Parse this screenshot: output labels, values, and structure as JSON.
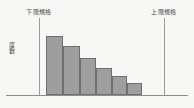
{
  "figure": {
    "background_color": "#f7f7f5",
    "axis_color": "#8d8d8d",
    "spec_line_color": "#9b9b9b",
    "bar_fill_color": "#9e9e9e",
    "bar_border_color": "#6f6f6f",
    "label_color": "#4a4a4a"
  },
  "labels": {
    "lower_spec": "下限規格",
    "upper_spec": "上限規格",
    "y_axis": "度數"
  },
  "chart_data": {
    "type": "bar",
    "title": "",
    "subtitle": "",
    "xlabel": "",
    "ylabel": "度數",
    "grid": false,
    "legend": null,
    "categories": [
      "1",
      "2",
      "3",
      "4",
      "5",
      "6"
    ],
    "values": [
      59,
      49,
      37,
      27,
      19,
      12
    ],
    "ylim": [
      0,
      64
    ],
    "xlim": [
      0,
      194
    ],
    "annotations": [
      {
        "name": "lower-spec-limit",
        "text": "下限規格",
        "x": 39,
        "orientation": "vertical"
      },
      {
        "name": "upper-spec-limit",
        "text": "上限規格",
        "x": 164,
        "orientation": "vertical"
      }
    ],
    "bar_geometry": [
      {
        "left": 46,
        "width": 17,
        "top": 36
      },
      {
        "left": 63,
        "width": 17,
        "top": 46
      },
      {
        "left": 80,
        "width": 16,
        "top": 58
      },
      {
        "left": 96,
        "width": 16,
        "top": 68
      },
      {
        "left": 112,
        "width": 15,
        "top": 76
      },
      {
        "left": 127,
        "width": 15,
        "top": 83
      }
    ],
    "baseline_y": 95,
    "spec_lines": [
      {
        "name": "lower",
        "x": 39,
        "top": 18,
        "bottom": 95
      },
      {
        "name": "upper",
        "x": 164,
        "top": 18,
        "bottom": 95
      }
    ]
  }
}
